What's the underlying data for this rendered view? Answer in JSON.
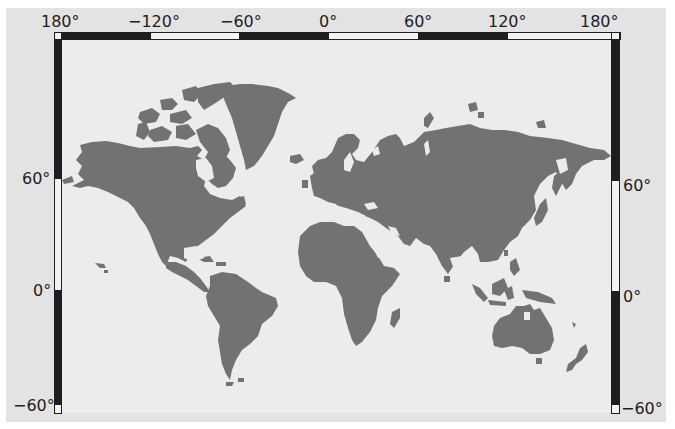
{
  "map": {
    "title_fragment": "",
    "colors": {
      "background": "#e3e3e3",
      "page": "#ffffff",
      "land": "#727272",
      "frame_dark": "#1e1e1e",
      "frame_light": "#f2f2f2"
    },
    "projection": "world map, Pacific-edged, longitude -180 to 180",
    "longitude_labels": [
      {
        "id": "lon-180w",
        "text": "180°",
        "x": 39
      },
      {
        "id": "lon-120w",
        "text": "−120°",
        "x": 128
      },
      {
        "id": "lon-60w",
        "text": "−60°",
        "x": 220
      },
      {
        "id": "lon-0",
        "text": "0°",
        "x": 318
      },
      {
        "id": "lon-60e",
        "text": "60°",
        "x": 405
      },
      {
        "id": "lon-120e",
        "text": "120°",
        "x": 487
      },
      {
        "id": "lon-180e",
        "text": "180°",
        "x": 580
      }
    ],
    "latitude_labels_left": [
      {
        "id": "lat-60n-left",
        "text": "60°",
        "y": 170
      },
      {
        "id": "lat-0-left",
        "text": "0°",
        "y": 283
      },
      {
        "id": "lat-60s-left",
        "text": "−60°",
        "y": 398
      }
    ],
    "latitude_labels_right": [
      {
        "id": "lat-60n-right",
        "text": "60°",
        "y": 178
      },
      {
        "id": "lat-0-right",
        "text": "0°",
        "y": 290
      },
      {
        "id": "lat-60s-right",
        "text": "−60°",
        "y": 401
      }
    ],
    "continents": [
      "North America",
      "Greenland",
      "South America",
      "Europe",
      "Asia",
      "Africa",
      "Australia",
      "New Zealand",
      "Antarctic-free",
      "Islands"
    ]
  }
}
